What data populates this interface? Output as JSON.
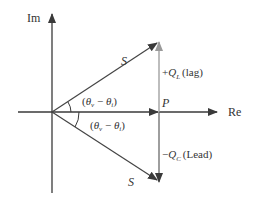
{
  "diagram": {
    "type": "phasor-power-triangle",
    "axes": {
      "imaginary_label": "Im",
      "real_label": "Re"
    },
    "vectors": {
      "apparent_power_upper": {
        "label": "S"
      },
      "apparent_power_lower": {
        "label": "S"
      },
      "real_power": {
        "label": "P"
      },
      "reactive_lag": {
        "sign": "+",
        "symbol": "Q",
        "subscript": "L",
        "suffix": "(lag)"
      },
      "reactive_lead": {
        "sign": "−",
        "symbol": "Q",
        "subscript": "C",
        "suffix": "(Lead)"
      }
    },
    "angles": {
      "upper": {
        "open": "(",
        "theta1": "θ",
        "sub1": "v",
        "minus": " − ",
        "theta2": "θ",
        "sub2": "i",
        "close": ")"
      },
      "lower": {
        "open": "(",
        "theta1": "θ",
        "sub1": "v",
        "minus": " − ",
        "theta2": "θ",
        "sub2": "i",
        "close": ")"
      }
    },
    "colors": {
      "axis": "#3a3a3a",
      "vector": "#444444",
      "lag_arrow": "#9a9a9a",
      "text": "#333333"
    }
  }
}
